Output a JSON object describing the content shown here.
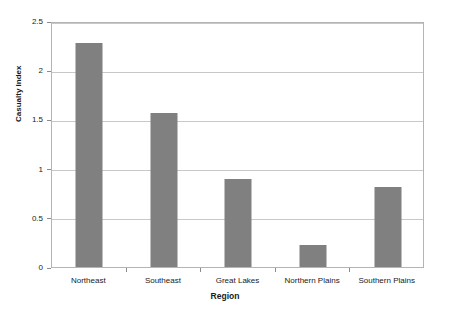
{
  "chart_data": {
    "type": "bar",
    "title": "",
    "subtitle": "",
    "xlabel": "Region",
    "ylabel": "Casualty Index",
    "categories": [
      "Northeast",
      "Southeast",
      "Great Lakes",
      "Northern Plains",
      "Southern Plains"
    ],
    "values": [
      2.28,
      1.57,
      0.89,
      0.22,
      0.81
    ],
    "ylim": [
      0,
      2.5
    ],
    "y_ticks": [
      0,
      0.5,
      1,
      1.5,
      2,
      2.5
    ],
    "y_tick_labels": [
      "0",
      "0.5",
      "1",
      "1.5",
      "2",
      "2.5"
    ],
    "grid": "horizontal",
    "legend": "none",
    "bar_color": "#808080",
    "gridline_color": "#c8c8c8",
    "axis_color": "#b4b4b4",
    "background_color": "#ffffff"
  }
}
